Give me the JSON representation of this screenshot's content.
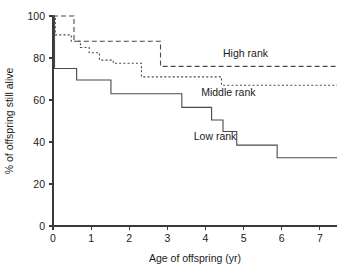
{
  "chart_data": {
    "type": "line",
    "title": "",
    "xlabel": "Age of offspring (yr)",
    "ylabel": "% of offspring still alive",
    "xlim": [
      0,
      7.45
    ],
    "ylim": [
      0,
      100
    ],
    "xticks": [
      0,
      1,
      2,
      3,
      4,
      5,
      6,
      7
    ],
    "yticks": [
      0,
      20,
      40,
      60,
      80,
      100
    ],
    "grid": false,
    "legend_position": "inline-annotations",
    "series": [
      {
        "name": "High rank",
        "style": "long-dashed",
        "label": "High rank",
        "label_x": 5.05,
        "label_y": 80.5,
        "points": [
          [
            0.0,
            100.0
          ],
          [
            0.55,
            100.0
          ],
          [
            0.55,
            88.0
          ],
          [
            2.82,
            88.0
          ],
          [
            2.82,
            76.0
          ],
          [
            7.45,
            76.0
          ]
        ]
      },
      {
        "name": "Middle rank",
        "style": "dotted",
        "label": "Middle rank",
        "label_x": 4.6,
        "label_y": 62.0,
        "points": [
          [
            0.0,
            100.0
          ],
          [
            0.06,
            100.0
          ],
          [
            0.06,
            91.0
          ],
          [
            0.48,
            91.0
          ],
          [
            0.48,
            88.0
          ],
          [
            0.72,
            88.0
          ],
          [
            0.72,
            85.0
          ],
          [
            0.95,
            85.0
          ],
          [
            0.95,
            82.5
          ],
          [
            1.22,
            82.5
          ],
          [
            1.22,
            79.0
          ],
          [
            1.58,
            79.0
          ],
          [
            1.58,
            77.5
          ],
          [
            2.32,
            77.5
          ],
          [
            2.32,
            71.0
          ],
          [
            4.42,
            71.0
          ],
          [
            4.42,
            67.0
          ],
          [
            7.45,
            67.0
          ]
        ]
      },
      {
        "name": "Low rank",
        "style": "solid",
        "label": "Low rank",
        "label_x": 4.25,
        "label_y": 41.0,
        "points": [
          [
            0.0,
            100.0
          ],
          [
            0.04,
            100.0
          ],
          [
            0.04,
            75.0
          ],
          [
            0.62,
            75.0
          ],
          [
            0.62,
            69.5
          ],
          [
            1.52,
            69.5
          ],
          [
            1.52,
            63.0
          ],
          [
            3.38,
            63.0
          ],
          [
            3.38,
            56.5
          ],
          [
            4.16,
            56.5
          ],
          [
            4.16,
            50.5
          ],
          [
            4.46,
            50.5
          ],
          [
            4.46,
            45.0
          ],
          [
            4.82,
            45.0
          ],
          [
            4.82,
            38.5
          ],
          [
            5.88,
            38.5
          ],
          [
            5.88,
            32.5
          ],
          [
            7.45,
            32.5
          ]
        ]
      }
    ]
  },
  "geometry": {
    "plot_left": 53,
    "plot_right": 337,
    "plot_top": 16,
    "plot_bottom": 226,
    "x_min": 0,
    "x_max": 7.45,
    "y_min": 0,
    "y_max": 100
  },
  "styles": {
    "axis_color": "#3a3a3a",
    "curve_color": "#4a4a4a",
    "text_color": "#1a1a1a",
    "background": "#ffffff"
  }
}
